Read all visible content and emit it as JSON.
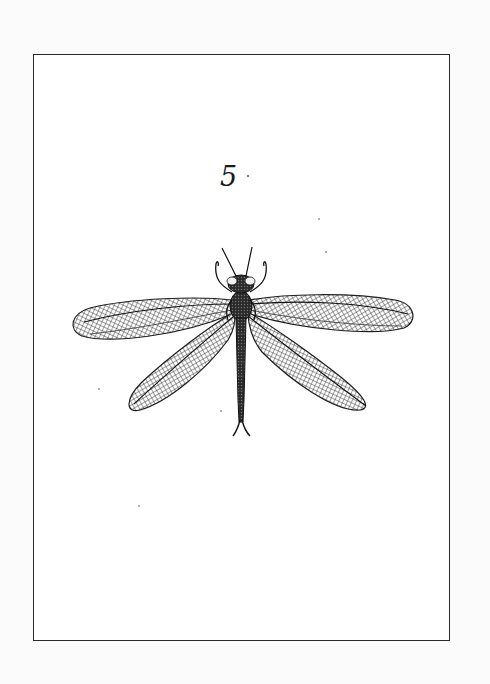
{
  "plate": {
    "number": "5",
    "subject": "dragonfly engraving",
    "frame_color": "#2a2a2a",
    "ink_color": "#1e1e1e",
    "paper_color": "#ffffff"
  }
}
